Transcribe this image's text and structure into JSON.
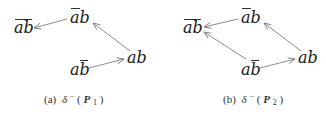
{
  "panels": [
    {
      "id": "a",
      "caption": {
        "label": "(a)",
        "func": "δ",
        "sup": "−",
        "open": "(",
        "var": "P",
        "sub": "1",
        "close": ")"
      },
      "nodes": [
        {
          "id": "not_ab",
          "text": "ab",
          "overline": "both"
        },
        {
          "id": "nota_b",
          "text": "ab",
          "overline": "a"
        },
        {
          "id": "ab",
          "text": "ab",
          "overline": "none"
        },
        {
          "id": "a_notb",
          "text": "ab",
          "overline": "b"
        }
      ],
      "edges": [
        {
          "from": "nota_b",
          "to": "not_ab"
        },
        {
          "from": "ab",
          "to": "nota_b"
        },
        {
          "from": "a_notb",
          "to": "ab"
        }
      ]
    },
    {
      "id": "b",
      "caption": {
        "label": "(b)",
        "func": "δ",
        "sup": "−",
        "open": "(",
        "var": "P",
        "sub": "2",
        "close": ")"
      },
      "nodes": [
        {
          "id": "not_ab",
          "text": "ab",
          "overline": "both"
        },
        {
          "id": "nota_b",
          "text": "ab",
          "overline": "a"
        },
        {
          "id": "ab",
          "text": "ab",
          "overline": "none"
        },
        {
          "id": "a_notb",
          "text": "ab",
          "overline": "b"
        }
      ],
      "edges": [
        {
          "from": "nota_b",
          "to": "not_ab"
        },
        {
          "from": "ab",
          "to": "nota_b"
        },
        {
          "from": "a_notb",
          "to": "ab"
        },
        {
          "from": "a_notb",
          "to": "not_ab"
        }
      ]
    }
  ],
  "colors": {
    "text": "#1a1a1a",
    "arrow": "#808080",
    "caption": "#333333"
  }
}
